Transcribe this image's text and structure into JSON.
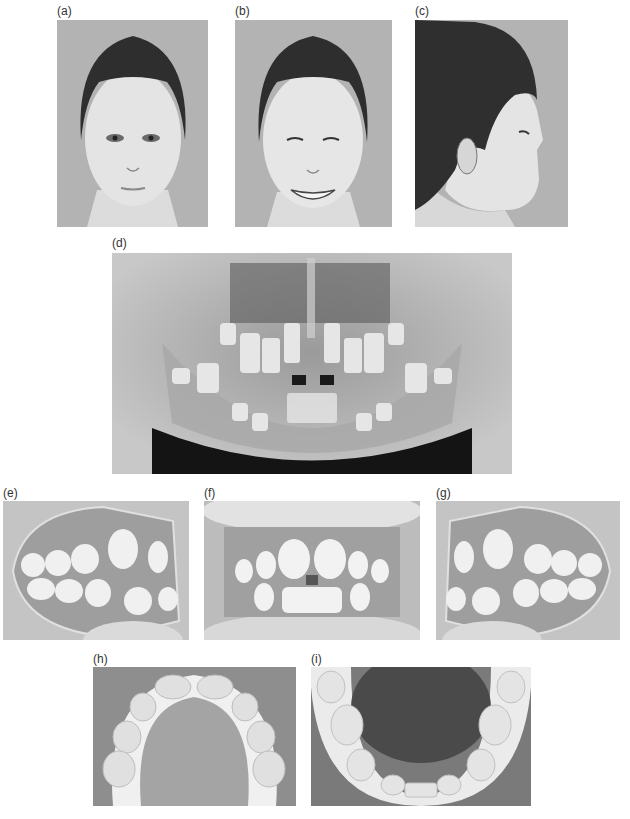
{
  "figure": {
    "panels": [
      {
        "id": "a",
        "label": "(a)",
        "content": "Frontal facial photograph, lips at rest"
      },
      {
        "id": "b",
        "label": "(b)",
        "content": "Frontal facial photograph, smiling"
      },
      {
        "id": "c",
        "label": "(c)",
        "content": "Right profile facial photograph"
      },
      {
        "id": "d",
        "label": "(d)",
        "content": "Panoramic radiograph showing mixed dentition"
      },
      {
        "id": "e",
        "label": "(e)",
        "content": "Right buccal intraoral photograph"
      },
      {
        "id": "f",
        "label": "(f)",
        "content": "Frontal intraoral photograph"
      },
      {
        "id": "g",
        "label": "(g)",
        "content": "Left buccal intraoral photograph"
      },
      {
        "id": "h",
        "label": "(h)",
        "content": "Maxillary occlusal photograph"
      },
      {
        "id": "i",
        "label": "(i)",
        "content": "Mandibular occlusal photograph"
      }
    ]
  }
}
